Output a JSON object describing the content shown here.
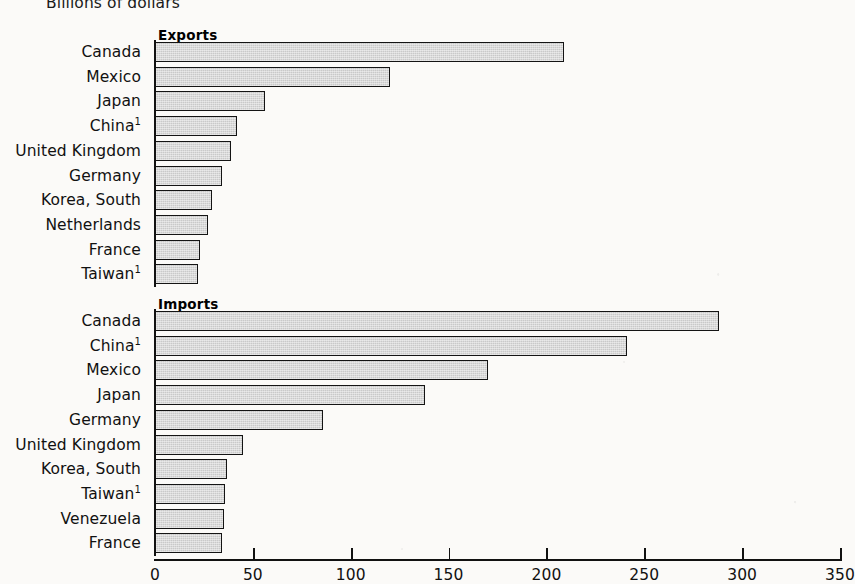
{
  "page": {
    "unit_label": "Billions of dollars"
  },
  "chart_data": {
    "type": "bar",
    "orientation": "horizontal",
    "title": "Billions of dollars",
    "xlabel": "",
    "ylabel": "",
    "xlim": [
      0,
      350
    ],
    "xticks": [
      0,
      50,
      100,
      150,
      200,
      250,
      300,
      350
    ],
    "grid": false,
    "legend": "none",
    "panels": [
      {
        "name": "exports",
        "title": "Exports",
        "categories": [
          "Canada",
          "Mexico",
          "Japan",
          "China",
          "United Kingdom",
          "Germany",
          "Korea, South",
          "Netherlands",
          "France",
          "Taiwan"
        ],
        "footnote_marks": [
          "",
          "",
          "",
          "1",
          "",
          "",
          "",
          "",
          "",
          "1"
        ],
        "values": [
          209,
          120,
          56,
          42,
          39,
          34,
          29,
          27,
          23,
          22
        ]
      },
      {
        "name": "imports",
        "title": "Imports",
        "categories": [
          "Canada",
          "China",
          "Mexico",
          "Japan",
          "Germany",
          "United Kingdom",
          "Korea, South",
          "Taiwan",
          "Venezuela",
          "France"
        ],
        "footnote_marks": [
          "",
          "1",
          "",
          "",
          "",
          "",
          "",
          "1",
          "",
          ""
        ],
        "values": [
          288,
          241,
          170,
          138,
          86,
          45,
          37,
          36,
          35,
          34
        ]
      }
    ],
    "colors": {
      "bar_fill": "#c9c9c9",
      "bar_border": "#141414",
      "axis": "#111111",
      "background": "#fbfaf8"
    }
  }
}
